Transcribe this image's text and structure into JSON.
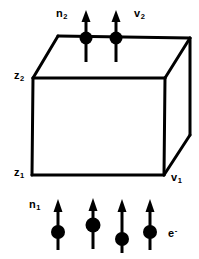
{
  "figure": {
    "width": 199,
    "height": 259,
    "background_color": "#ffffff",
    "stroke_color": "#000000"
  },
  "labels": {
    "n2": {
      "base": "n",
      "sub": "2"
    },
    "v2": {
      "base": "v",
      "sub": "2"
    },
    "z2": {
      "base": "z",
      "sub": "2"
    },
    "z1": {
      "base": "z",
      "sub": "1"
    },
    "v1": {
      "base": "v",
      "sub": "1"
    },
    "n1": {
      "base": "n",
      "sub": "1"
    },
    "electron": {
      "base": "e",
      "sup": "-"
    }
  },
  "box": {
    "name": "slab",
    "face_fill": "#ffffff",
    "edge_color": "#000000",
    "edge_width": 3,
    "vertices": {
      "front_top_left": [
        33,
        78
      ],
      "front_top_right": [
        165,
        78
      ],
      "front_bottom_left": [
        32,
        175
      ],
      "front_bottom_right": [
        164,
        175
      ],
      "back_top_left": [
        58,
        36
      ],
      "back_top_right": [
        190,
        38
      ],
      "back_bottom_right": [
        190,
        135
      ]
    }
  },
  "spins_top": {
    "count": 2,
    "label_left": "n2",
    "label_right": "v2",
    "direction": "up",
    "items": [
      {
        "x": 86,
        "circle_y": 38,
        "arrow_top": 12,
        "tail_bottom": 62
      },
      {
        "x": 116,
        "circle_y": 38,
        "arrow_top": 12,
        "tail_bottom": 62
      }
    ]
  },
  "spins_bottom": {
    "count": 4,
    "label_left": "n1",
    "label_right": "electron",
    "direction": "up",
    "items": [
      {
        "x": 58,
        "circle_y": 232,
        "arrow_top": 200,
        "tail_bottom": 250
      },
      {
        "x": 93,
        "circle_y": 225,
        "arrow_top": 198,
        "tail_bottom": 248
      },
      {
        "x": 122,
        "circle_y": 239,
        "arrow_top": 199,
        "tail_bottom": 252
      },
      {
        "x": 150,
        "circle_y": 232,
        "arrow_top": 199,
        "tail_bottom": 250
      }
    ]
  }
}
